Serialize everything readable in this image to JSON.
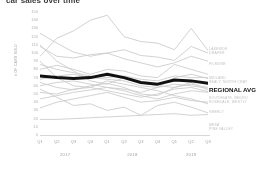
{
  "chart_data": {
    "type": "line",
    "title": "car sales over time",
    "xlabel": "",
    "ylabel": "# OF CARS SOLD",
    "ylim": [
      0,
      150
    ],
    "ytick_step": 10,
    "yticks": [
      150,
      140,
      130,
      120,
      110,
      100,
      90,
      80,
      70,
      60,
      50,
      40,
      30,
      20,
      10,
      0
    ],
    "grid": false,
    "legend_position": "right-edge-labels",
    "categories": [
      "Q1",
      "Q2",
      "Q3",
      "Q4",
      "Q1",
      "Q2",
      "Q3",
      "Q4",
      "Q1",
      "Q2",
      "Q3"
    ],
    "year_groups": [
      {
        "label": "2017",
        "quarters": [
          "Q1",
          "Q2",
          "Q3",
          "Q4"
        ]
      },
      {
        "label": "2018",
        "quarters": [
          "Q1",
          "Q2",
          "Q3",
          "Q4"
        ]
      },
      {
        "label": "2019",
        "quarters": [
          "Q1",
          "Q2",
          "Q3"
        ]
      }
    ],
    "highlight_series": "REGIONAL AVG",
    "series": [
      {
        "name": "REGIONAL AVG",
        "highlight": true,
        "values": [
          72,
          70,
          69,
          70,
          74,
          70,
          64,
          62,
          67,
          66,
          63
        ]
      },
      {
        "name": "LAKESIDE",
        "values": [
          96,
          118,
          127,
          140,
          146,
          120,
          114,
          112,
          104,
          130,
          103
        ]
      },
      {
        "name": "DRAPER",
        "values": [
          124,
          112,
          101,
          96,
          100,
          104,
          97,
          95,
          91,
          108,
          100
        ]
      },
      {
        "name": "FILMORE",
        "values": [
          108,
          96,
          94,
          98,
          100,
          93,
          88,
          83,
          88,
          96,
          90
        ]
      },
      {
        "name": "MIDLAND",
        "values": [
          80,
          85,
          80,
          74,
          80,
          78,
          72,
          70,
          86,
          80,
          74
        ]
      },
      {
        "name": "SEALY",
        "values": [
          86,
          80,
          76,
          72,
          70,
          72,
          68,
          66,
          72,
          70,
          70
        ]
      },
      {
        "name": "NORTH CRAY",
        "values": [
          68,
          72,
          74,
          70,
          68,
          66,
          60,
          58,
          70,
          74,
          69
        ]
      },
      {
        "name": "SOUTHGATE",
        "values": [
          60,
          64,
          66,
          62,
          58,
          56,
          52,
          58,
          62,
          60,
          57
        ]
      },
      {
        "name": "BEDRO",
        "values": [
          64,
          58,
          55,
          60,
          63,
          58,
          50,
          48,
          58,
          64,
          55
        ]
      },
      {
        "name": "ROSEDALE",
        "values": [
          52,
          50,
          56,
          58,
          54,
          50,
          46,
          50,
          56,
          58,
          53
        ]
      },
      {
        "name": "WESTLY",
        "values": [
          44,
          48,
          52,
          55,
          58,
          54,
          48,
          44,
          50,
          54,
          52
        ]
      },
      {
        "name": "GREELY",
        "values": [
          33,
          40,
          44,
          48,
          52,
          46,
          40,
          42,
          46,
          42,
          40
        ]
      },
      {
        "name": "MESA",
        "values": [
          56,
          46,
          36,
          38,
          30,
          34,
          24,
          36,
          40,
          34,
          27
        ]
      },
      {
        "name": "PINE VALLEY",
        "values": [
          19,
          19,
          20,
          21,
          22,
          23,
          24,
          25,
          26,
          24,
          25
        ]
      },
      {
        "name": "SERIES-14",
        "values": [
          110,
          90,
          78,
          66,
          62,
          70,
          64,
          60,
          58,
          62,
          58
        ]
      },
      {
        "name": "SERIES-15",
        "values": [
          90,
          70,
          60,
          58,
          66,
          62,
          58,
          54,
          48,
          44,
          38
        ]
      }
    ]
  },
  "axis_titles": {
    "y": "# OF CARS SOLD"
  },
  "right_labels": [
    {
      "text": "LAKESIDE",
      "top": 36
    },
    {
      "text": "DRAPER",
      "top": 40
    },
    {
      "text": "FILMORE",
      "top": 51
    },
    {
      "text": "MIDLAND",
      "top": 65
    },
    {
      "text": "SEALY, NORTH CRAY",
      "top": 69
    },
    {
      "text": "REGIONAL AVG",
      "top": 76
    },
    {
      "text": "SOUTHGATE, BEDRO",
      "top": 85
    },
    {
      "text": "ROSEDALE, WESTLY",
      "top": 89
    },
    {
      "text": "GREELY",
      "top": 99
    },
    {
      "text": "MESA",
      "top": 112
    },
    {
      "text": "PINE VALLEY",
      "top": 116
    }
  ],
  "colors": {
    "background": "#ffffff",
    "series_gray": "#cdcdcd",
    "highlight": "#111111",
    "tick_text": "#9e9e9e",
    "axis": "#d8d8d8"
  }
}
